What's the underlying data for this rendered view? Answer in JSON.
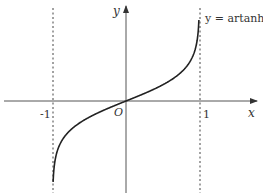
{
  "chart_data": {
    "type": "line",
    "title": "",
    "function_label": "y = artanh x",
    "xlabel": "x",
    "ylabel": "y",
    "origin_label": "O",
    "x_ticks": [
      {
        "value": -1,
        "label": "-1"
      },
      {
        "value": 1,
        "label": "1"
      }
    ],
    "asymptotes": [
      -1,
      1
    ],
    "xlim": [
      -1.64,
      1.74
    ],
    "ylim": [
      -3.2,
      3.2
    ],
    "grid": false,
    "series": [
      {
        "name": "artanh x",
        "x": [
          -0.995,
          -0.99,
          -0.98,
          -0.95,
          -0.9,
          -0.8,
          -0.6,
          -0.4,
          -0.2,
          0,
          0.2,
          0.4,
          0.6,
          0.8,
          0.9,
          0.95,
          0.98,
          0.99,
          0.995
        ],
        "values": [
          -2.99,
          -2.65,
          -2.3,
          -1.83,
          -1.47,
          -1.1,
          -0.69,
          -0.42,
          -0.2,
          0,
          0.2,
          0.42,
          0.69,
          1.1,
          1.47,
          1.83,
          2.3,
          2.65,
          2.99
        ]
      }
    ],
    "colors": {
      "curve": "#222222",
      "axes": "#555555",
      "asymptote": "#444444",
      "text": "#333333"
    }
  }
}
